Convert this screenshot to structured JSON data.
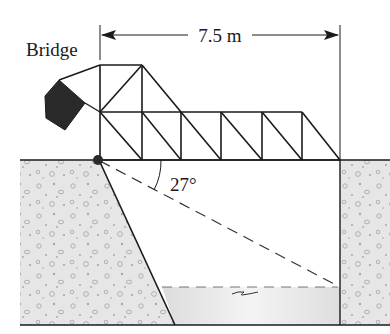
{
  "figure": {
    "bridge_label": "Bridge",
    "span_label": "7.5 m",
    "angle_label": "27°",
    "colors": {
      "line": "#1a1a1a",
      "counterweight": "#2a2a2a",
      "ground_fill": "#e4e4e4",
      "water_fill": "#e9e9e9",
      "pebble": "#9a9a9a",
      "background": "#ffffff"
    },
    "elements": {
      "truss": "drawbridge-truss",
      "counterweight": "counterweight-block",
      "pivot": "hinge-pivot",
      "left_bank": "left-bank-concrete",
      "right_bank": "right-bank-concrete",
      "water": "river-water",
      "sight_line": "dashed-sight-line"
    }
  }
}
